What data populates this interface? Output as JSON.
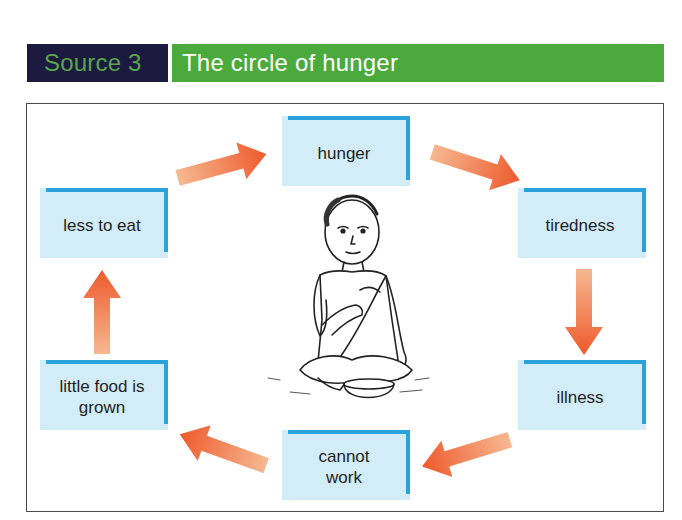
{
  "header": {
    "source_label": "Source 3",
    "title": "The circle of hunger",
    "colors": {
      "source_bg": "#1c1a3f",
      "source_text": "#57a64b",
      "title_bg": "#4aaa3c",
      "title_text": "#ffffff"
    }
  },
  "diagram": {
    "type": "cycle",
    "nodes": [
      {
        "id": "hunger",
        "label": "hunger"
      },
      {
        "id": "tiredness",
        "label": "tiredness"
      },
      {
        "id": "illness",
        "label": "illness"
      },
      {
        "id": "cannot_work",
        "label": "cannot work"
      },
      {
        "id": "little_food",
        "label": "little food is grown"
      },
      {
        "id": "less_to_eat",
        "label": "less to eat"
      }
    ],
    "edges": [
      {
        "from": "hunger",
        "to": "tiredness"
      },
      {
        "from": "tiredness",
        "to": "illness"
      },
      {
        "from": "illness",
        "to": "cannot_work"
      },
      {
        "from": "cannot_work",
        "to": "little_food"
      },
      {
        "from": "little_food",
        "to": "less_to_eat"
      },
      {
        "from": "less_to_eat",
        "to": "hunger"
      }
    ],
    "center_image": "illustration of a starving child sitting cross-legged with an empty bowl",
    "colors": {
      "box_fill": "#d2ecf8",
      "box_border": "#2aa3dc",
      "arrow_dark": "#ee5a2c",
      "arrow_light": "#f6b08a"
    }
  }
}
